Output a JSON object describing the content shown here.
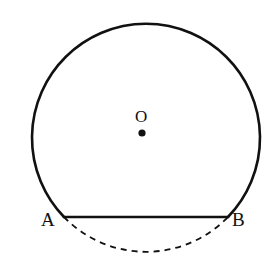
{
  "figure": {
    "type": "geometry-diagram",
    "background_color": "#ffffff",
    "stroke_color": "#111111",
    "labels": {
      "center": "O",
      "left_point": "A",
      "right_point": "B"
    },
    "geometry": {
      "circle": {
        "center_x": 142,
        "center_y": 133,
        "radius": 114,
        "stroke_width": 2.6
      },
      "center_dot": {
        "cx": 142,
        "cy": 133,
        "r": 3.6,
        "fill": "#111111"
      },
      "point_a": {
        "x": 64,
        "y": 217
      },
      "point_b": {
        "x": 228,
        "y": 217
      },
      "chord": {
        "x1": 64,
        "y1": 217,
        "x2": 228,
        "y2": 217,
        "stroke_width": 2.6
      },
      "major_arc_path": "M 64 217 A 114 114 0 1 1 228 217",
      "minor_arc_path": "M 64 217 A 114 114 0 0 0 228 217",
      "minor_arc_dash": "6 5",
      "minor_arc_stroke_width": 1.8,
      "minor_arc_lowest_y": 244
    },
    "label_positions": {
      "a": {
        "x": 41,
        "y": 210
      },
      "b": {
        "x": 232,
        "y": 210
      },
      "o": {
        "x": 135,
        "y": 108
      }
    }
  }
}
